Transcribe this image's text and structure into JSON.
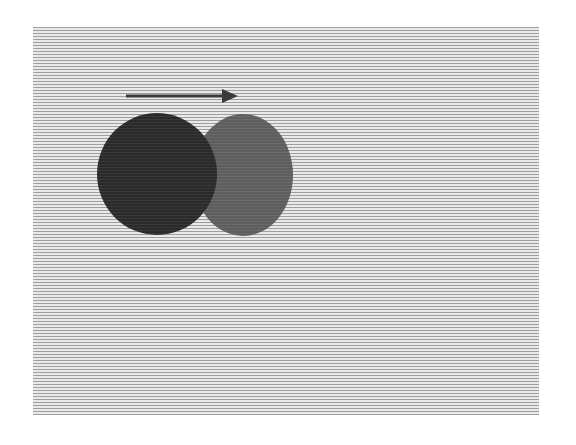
{
  "figure": {
    "background": {
      "stripe_color": "#9e9e9e",
      "gap_color": "#e9e9e9",
      "x": 33,
      "y": 27,
      "width": 506,
      "height": 388
    },
    "arrow": {
      "direction": "right",
      "x1": 126,
      "y1": 96,
      "x2": 238,
      "y2": 96,
      "color": "#3a3a3a",
      "icon": "arrow-right-icon"
    },
    "shapes": [
      {
        "name": "ghost-circle",
        "cx": 243,
        "cy": 175,
        "rx": 50,
        "ry": 61,
        "color": "#5e5e5e"
      },
      {
        "name": "solid-circle",
        "cx": 157,
        "cy": 174,
        "rx": 60,
        "ry": 61,
        "color": "#2a2a2a"
      }
    ]
  }
}
